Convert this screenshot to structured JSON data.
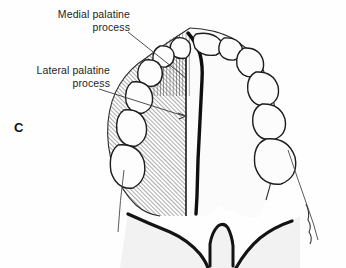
{
  "figure": {
    "panel_letter": "C",
    "background_color": "#fefefe",
    "ink_color": "#111111"
  },
  "labels": [
    {
      "id": "medial",
      "text": "Medial palatine\nprocess",
      "name": "medial-palatine-process-label",
      "leader_from": [
        128,
        32
      ],
      "leader_to": [
        186,
        78
      ],
      "hatch_style": "vertical"
    },
    {
      "id": "lateral",
      "text": "Lateral palatine\nprocess",
      "name": "lateral-palatine-process-label",
      "leader_from": [
        99,
        89
      ],
      "leader_to": [
        186,
        116
      ],
      "hatch_style": "diagonal"
    }
  ],
  "regions": {
    "medial_palatine_process": {
      "label": "Medial palatine process",
      "fill": "vertical-hatch",
      "side": "left-anterior"
    },
    "lateral_palatine_process": {
      "label": "Lateral palatine process",
      "fill": "diagonal-hatch",
      "side": "left"
    },
    "right_palate": {
      "label": "Unshaded right palate",
      "fill": "none",
      "side": "right"
    }
  },
  "anatomy": {
    "midline_suture": "median palatine suture",
    "posterior_notch": "posterior nasal spine",
    "left_teeth_count": 5,
    "right_teeth_count": 7
  }
}
